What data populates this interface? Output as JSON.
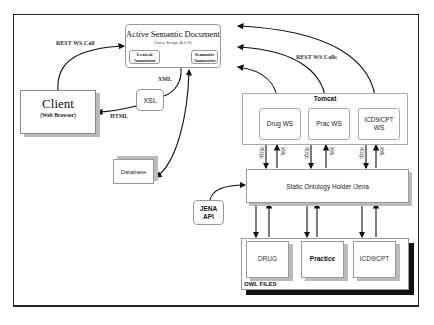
{
  "diagram": {
    "active_semantic_document": {
      "title": "Active Semantic Document",
      "subtitle": "(Java Script & C#)",
      "lexical_annotator": "Lexical Annotator",
      "semantic_annotator": "Semantic Annotator"
    },
    "client": {
      "title": "Client",
      "subtitle": "(Web Browser)"
    },
    "xsl": "XSL",
    "database": "Database",
    "tomcat": {
      "title": "Tomcat",
      "services": [
        "Drug WS",
        "Prac WS",
        "ICD9/CPT WS"
      ]
    },
    "static_ontology_holder": "Static Ontology Holder /Jena",
    "jena_api": "JENA API",
    "owl_files": {
      "label": "OWL FILES",
      "files": [
        "DRUG",
        "Practice",
        "ICD9/CPT"
      ]
    },
    "edge_labels": {
      "rest_ws_call": "REST WS Call",
      "rest_ws_calls": "REST WS Calls",
      "xml": "XML",
      "html": "HTML",
      "rdql": "RDQL",
      "xml_vertical": "XML"
    }
  }
}
